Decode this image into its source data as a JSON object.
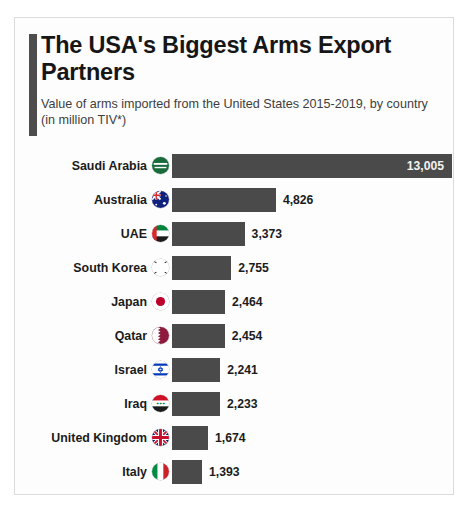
{
  "card": {
    "title": "The USA's Biggest Arms Export Partners",
    "subtitle": "Value of arms imported from the United States 2015-2019, by country (in million TIV*)"
  },
  "colors": {
    "bar": "#4a4a4a",
    "accent_bar": "#4d4d4d",
    "card_background": "#fdfdfd",
    "card_border": "#dcdcdc",
    "title_text": "#161616",
    "subtitle_text": "#3d3d3d",
    "value_inside_text": "#f2f2f2",
    "value_outside_text": "#1b1b1b"
  },
  "chart_data": {
    "type": "bar",
    "orientation": "horizontal",
    "title": "The USA's Biggest Arms Export Partners",
    "subtitle": "Value of arms imported from the United States 2015-2019, by country (in million TIV*)",
    "xlabel": "",
    "ylabel": "",
    "xlim": [
      0,
      13005
    ],
    "grid": false,
    "legend": false,
    "unit": "million TIV",
    "categories": [
      "Saudi Arabia",
      "Australia",
      "UAE",
      "South Korea",
      "Japan",
      "Qatar",
      "Israel",
      "Iraq",
      "United Kingdom",
      "Italy"
    ],
    "values": [
      13005,
      4826,
      3373,
      2755,
      2464,
      2454,
      2241,
      2233,
      1674,
      1393
    ],
    "value_labels": [
      "13,005",
      "4,826",
      "3,373",
      "2,755",
      "2,464",
      "2,454",
      "2,241",
      "2,233",
      "1,674",
      "1,393"
    ],
    "label_placement": [
      "inside",
      "outside",
      "outside",
      "outside",
      "outside",
      "outside",
      "outside",
      "outside",
      "outside",
      "outside"
    ],
    "icons": [
      "flag-saudi-arabia-icon",
      "flag-australia-icon",
      "flag-uae-icon",
      "flag-south-korea-icon",
      "flag-japan-icon",
      "flag-qatar-icon",
      "flag-israel-icon",
      "flag-iraq-icon",
      "flag-united-kingdom-icon",
      "flag-italy-icon"
    ]
  }
}
